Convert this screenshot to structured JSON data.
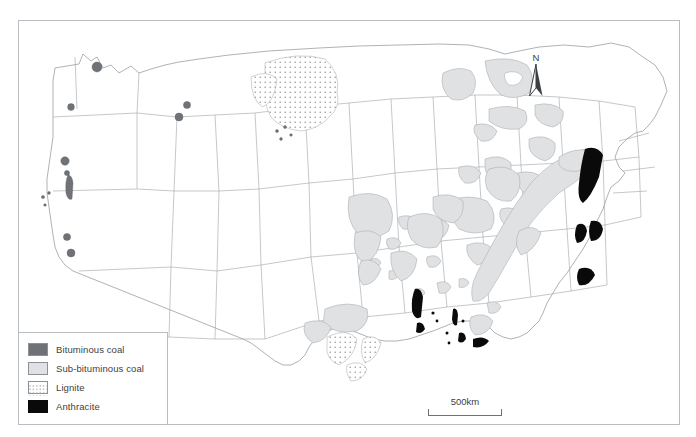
{
  "map": {
    "title": "Coal deposits of the contiguous United States",
    "frame_color": "#b9bcc0",
    "land_outline_color": "#8d9196",
    "background": "#ffffff"
  },
  "legend": {
    "items": [
      {
        "label": "Bituminous coal",
        "swatch": "bituminous-swatch",
        "color": "#6f7276",
        "pattern": "solid"
      },
      {
        "label": "Sub-bituminous coal",
        "swatch": "sub-bituminous-swatch",
        "color": "#dfe1e3",
        "pattern": "solid"
      },
      {
        "label": "Lignite",
        "swatch": "lignite-swatch",
        "color": "#ffffff",
        "pattern": "dotted"
      },
      {
        "label": "Anthracite",
        "swatch": "anthracite-swatch",
        "color": "#0a0a0a",
        "pattern": "solid"
      }
    ]
  },
  "scale_bar": {
    "label": "500km",
    "length_px": 74
  },
  "compass": {
    "label": "N",
    "icon": "north-arrow-icon"
  }
}
